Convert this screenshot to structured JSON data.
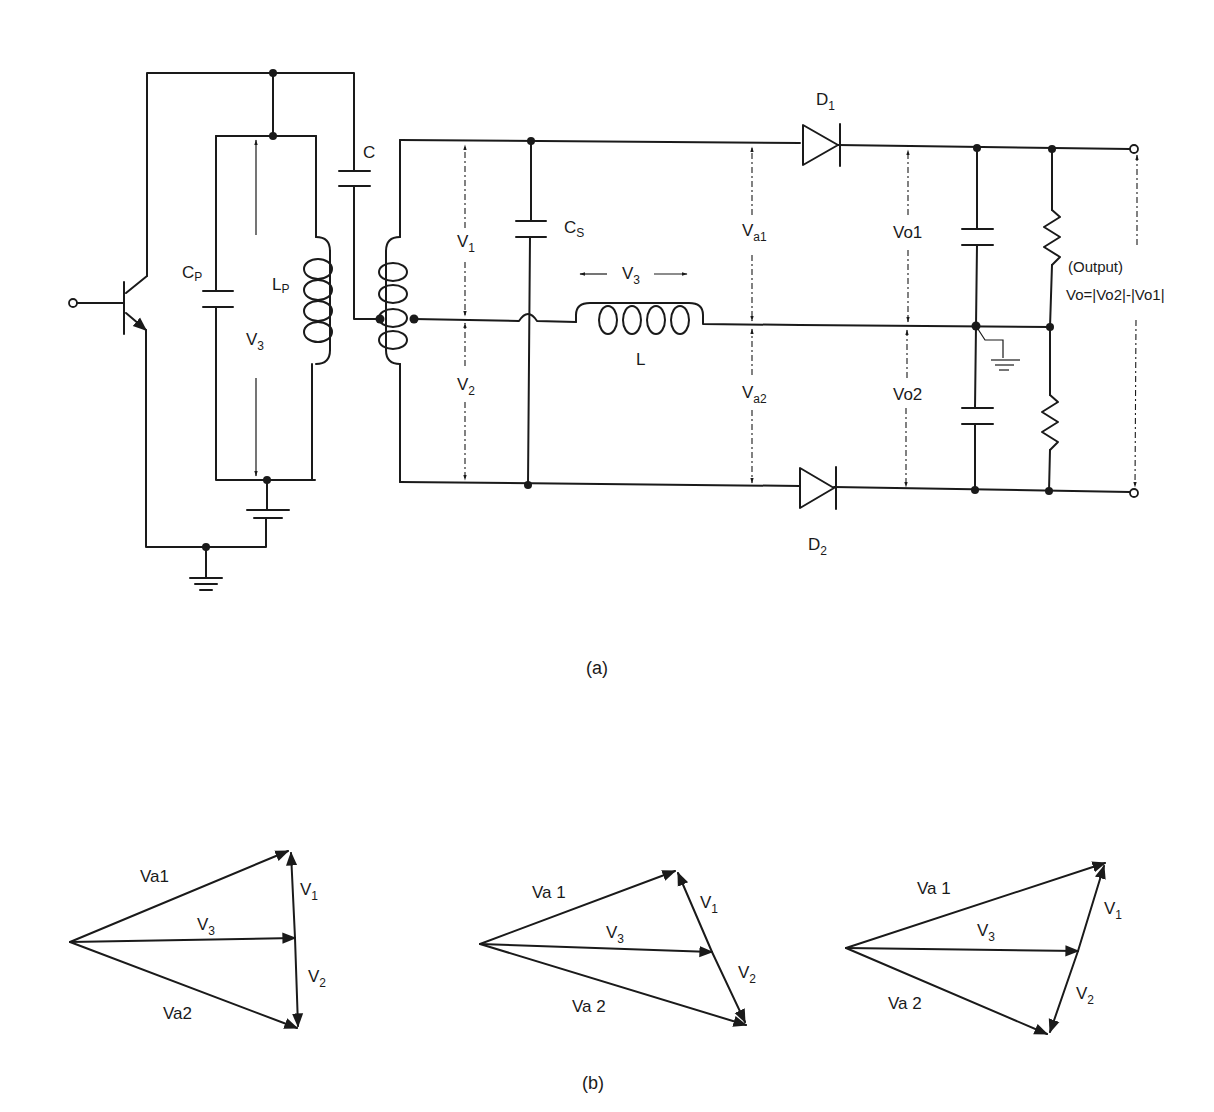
{
  "figure_a": {
    "caption": "(a)",
    "labels": {
      "capacitor_c": "C",
      "cp_main": "C",
      "cp_sub": "P",
      "lp_main": "L",
      "lp_sub": "P",
      "v3_tank_main": "V",
      "v3_tank_sub": "3",
      "v1_main": "V",
      "v1_sub": "1",
      "v2_main": "V",
      "v2_sub": "2",
      "cs_main": "C",
      "cs_sub": "S",
      "v3_l_main": "V",
      "v3_l_sub": "3",
      "inductor_l": "L",
      "va1_main": "V",
      "va1_sub": "a1",
      "va2_main": "V",
      "va2_sub": "a2",
      "d1_main": "D",
      "d1_sub": "1",
      "d2_main": "D",
      "d2_sub": "2",
      "vo1": "Vo1",
      "vo2": "Vo2",
      "output_title": "(Output)",
      "output_formula": "Vo=|Vo2|-|Vo1|"
    }
  },
  "figure_b": {
    "caption": "(b)",
    "phasors": [
      {
        "va1": "Va1",
        "va2": "Va2",
        "v1_main": "V",
        "v1_sub": "1",
        "v2_main": "V",
        "v2_sub": "2",
        "v3_main": "V",
        "v3_sub": "3"
      },
      {
        "va1": "Va 1",
        "va2": "Va 2",
        "v1_main": "V",
        "v1_sub": "1",
        "v2_main": "V",
        "v2_sub": "2",
        "v3_main": "V",
        "v3_sub": "3"
      },
      {
        "va1": "Va 1",
        "va2": "Va 2",
        "v1_main": "V",
        "v1_sub": "1",
        "v2_main": "V",
        "v2_sub": "2",
        "v3_main": "V",
        "v3_sub": "3"
      }
    ]
  }
}
